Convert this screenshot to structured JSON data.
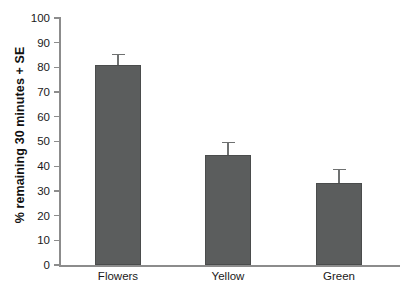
{
  "chart_data": {
    "type": "bar",
    "title": "",
    "subtitle": "",
    "xlabel": "",
    "ylabel": "% remaining 30 minutes + SE",
    "categories": [
      "Flowers",
      "Yellow",
      "Green"
    ],
    "values": [
      81,
      44.5,
      33
    ],
    "errors": [
      4.5,
      5.5,
      6
    ],
    "error_type": "SE",
    "ylim": [
      0,
      100
    ],
    "ytick_labels": [
      "0",
      "10",
      "20",
      "30",
      "40",
      "50",
      "60",
      "70",
      "80",
      "90",
      "100"
    ],
    "ytick_values": [
      0,
      10,
      20,
      30,
      40,
      50,
      60,
      70,
      80,
      90,
      100
    ],
    "grid": false,
    "legend": false,
    "legend_position": "none",
    "bar_color": "#5b5d5d",
    "axis_color": "#8c8c8c",
    "background_color": "#ffffff",
    "annotations": []
  }
}
